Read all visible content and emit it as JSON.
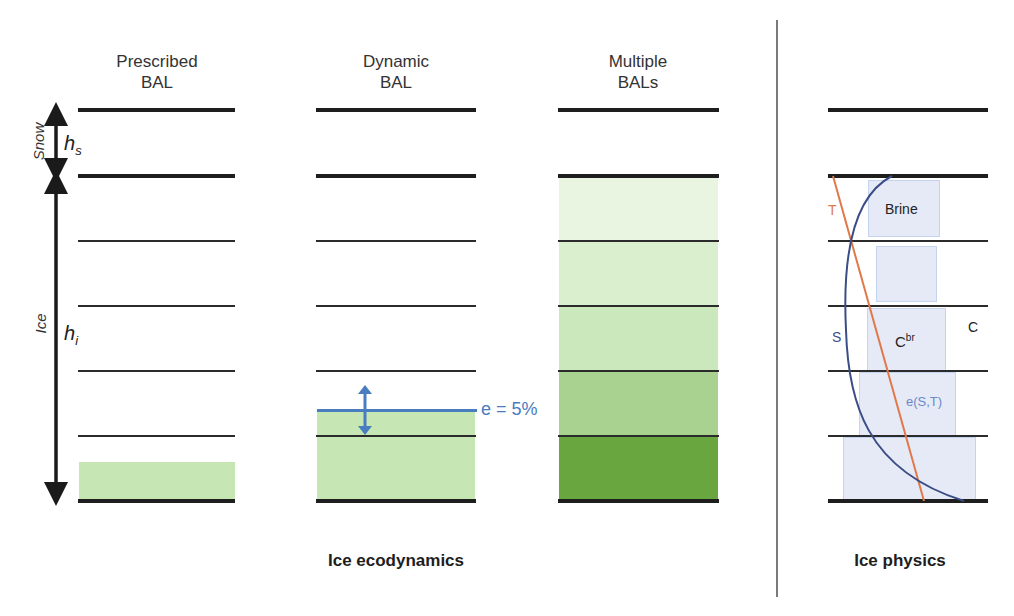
{
  "columns": [
    {
      "title": "Prescribed\nBAL"
    },
    {
      "title": "Dynamic\nBAL"
    },
    {
      "title": "Multiple\nBALs"
    }
  ],
  "left_axis": {
    "snow_label": "Snow",
    "snow_symbol": "h",
    "snow_subscript": "s",
    "ice_label": "Ice",
    "ice_symbol": "h",
    "ice_subscript": "i"
  },
  "dynamic_bal": {
    "annotation": "e = 5%",
    "line_color": "#4a7cc0"
  },
  "multiple_bals": {
    "layer_colors": [
      "#e9f5e1",
      "#d9efce",
      "#cbe8bd",
      "#a9d290",
      "#6aa63f"
    ]
  },
  "prescribed_bal": {
    "fill_color": "#c6e6b4"
  },
  "physics": {
    "labels": {
      "T": "T",
      "brine": "Brine",
      "S": "S",
      "C_br": "C",
      "C_br_sup": "br",
      "C": "C",
      "e": "e(S,T)"
    },
    "colors": {
      "temperature": "#e0784a",
      "salinity": "#3b4d86",
      "brine_box": "#e6eaf6",
      "e_label": "#6b88c8"
    }
  },
  "sections": {
    "ecodynamics": "Ice ecodynamics",
    "physics": "Ice physics"
  }
}
